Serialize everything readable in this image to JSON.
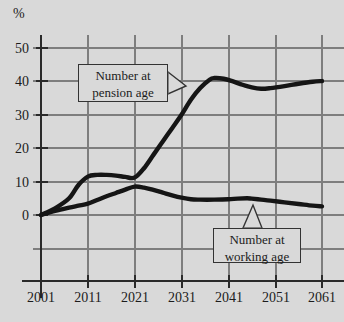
{
  "chart_data": {
    "type": "line",
    "title": "",
    "xlabel": "",
    "ylabel": "%",
    "xlim": [
      2001,
      2061
    ],
    "ylim": [
      -10,
      55
    ],
    "grid": true,
    "legend_position": "inline-callouts",
    "x_ticks": [
      "2001",
      "2011",
      "2021",
      "2031",
      "2041",
      "2051",
      "2061"
    ],
    "y_ticks": [
      "0",
      "10",
      "20",
      "30",
      "40",
      "50"
    ],
    "series": [
      {
        "name": "Number at pension age",
        "color": "#151515",
        "x": [
          2001,
          2004,
          2007,
          2009,
          2011,
          2013,
          2015,
          2017,
          2019,
          2021,
          2023,
          2025,
          2027,
          2029,
          2031,
          2033,
          2035,
          2037,
          2038,
          2040,
          2042,
          2044,
          2046,
          2048,
          2050,
          2053,
          2056,
          2059,
          2061
        ],
        "values": [
          0,
          2,
          5,
          9,
          11.5,
          12,
          12,
          11.8,
          11.4,
          11.2,
          14,
          18,
          22,
          26,
          30,
          34.5,
          38,
          40.5,
          41,
          40.8,
          40,
          39,
          38.2,
          37.8,
          38,
          38.6,
          39.3,
          39.9,
          40.1
        ]
      },
      {
        "name": "Number at working age",
        "color": "#151515",
        "x": [
          2001,
          2004,
          2007,
          2009,
          2011,
          2013,
          2015,
          2017,
          2019,
          2021,
          2023,
          2025,
          2027,
          2029,
          2031,
          2033,
          2035,
          2038,
          2041,
          2043,
          2045,
          2046,
          2048,
          2050,
          2053,
          2056,
          2059,
          2061
        ],
        "values": [
          0,
          1.2,
          2.2,
          2.8,
          3.4,
          4.5,
          5.6,
          6.6,
          7.6,
          8.5,
          8.2,
          7.5,
          6.7,
          5.9,
          5.2,
          4.7,
          4.6,
          4.6,
          4.7,
          4.9,
          5.0,
          4.9,
          4.6,
          4.3,
          3.8,
          3.3,
          2.8,
          2.6
        ]
      }
    ],
    "annotations": [
      {
        "name": "pension-callout",
        "lines": [
          "Number at",
          "pension age"
        ],
        "points_to_series": "Number at pension age"
      },
      {
        "name": "working-callout",
        "lines": [
          "Number at",
          "working age"
        ],
        "points_to_series": "Number at working age"
      }
    ],
    "colors": {
      "background": "#d9d9d9",
      "grid": "#7e7e7e",
      "axis": "#2a2a2a",
      "line": "#151515",
      "text": "#1c1c1c"
    }
  }
}
